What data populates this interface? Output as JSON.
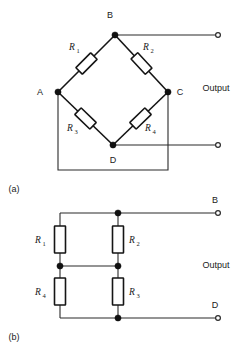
{
  "figure": {
    "panels": [
      {
        "caption": "(a)",
        "type": "wheatstone-bridge-diamond",
        "nodes": [
          {
            "name": "A",
            "label": "A"
          },
          {
            "name": "B",
            "label": "B"
          },
          {
            "name": "C",
            "label": "C"
          },
          {
            "name": "D",
            "label": "D"
          }
        ],
        "resistors": [
          {
            "name": "R1",
            "letter": "R",
            "subscript": "1",
            "between": [
              "A",
              "B"
            ]
          },
          {
            "name": "R2",
            "letter": "R",
            "subscript": "2",
            "between": [
              "B",
              "C"
            ]
          },
          {
            "name": "R3",
            "letter": "R",
            "subscript": "3",
            "between": [
              "A",
              "D"
            ]
          },
          {
            "name": "R4",
            "letter": "R",
            "subscript": "4",
            "between": [
              "D",
              "C"
            ]
          }
        ],
        "output_label": "Output",
        "terminals": [
          {
            "name": "output-top",
            "from_node": "B"
          },
          {
            "name": "output-bottom",
            "from_node": "D"
          }
        ]
      },
      {
        "caption": "(b)",
        "type": "wheatstone-bridge-ladder",
        "resistors": [
          {
            "name": "R1",
            "letter": "R",
            "subscript": "1",
            "position": "left-upper"
          },
          {
            "name": "R2",
            "letter": "R",
            "subscript": "2",
            "position": "right-upper"
          },
          {
            "name": "R4",
            "letter": "R",
            "subscript": "4",
            "position": "left-lower"
          },
          {
            "name": "R3",
            "letter": "R",
            "subscript": "3",
            "position": "right-lower"
          }
        ],
        "output_label": "Output",
        "terminals": [
          {
            "name": "output-top",
            "label": "B"
          },
          {
            "name": "output-bottom",
            "label": "D"
          }
        ]
      }
    ]
  }
}
